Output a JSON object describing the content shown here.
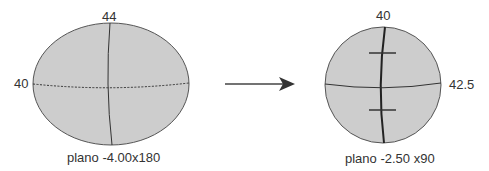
{
  "left_lens": {
    "top_power": "44",
    "side_power": "40",
    "caption": "plano -4.00x180"
  },
  "right_lens": {
    "top_power": "40",
    "side_power": "42.5",
    "caption": "plano -2.50 x90"
  },
  "arrow": {
    "icon": "right-arrow-icon"
  },
  "colors": {
    "fill": "#cfcfcf",
    "stroke": "#444444"
  }
}
